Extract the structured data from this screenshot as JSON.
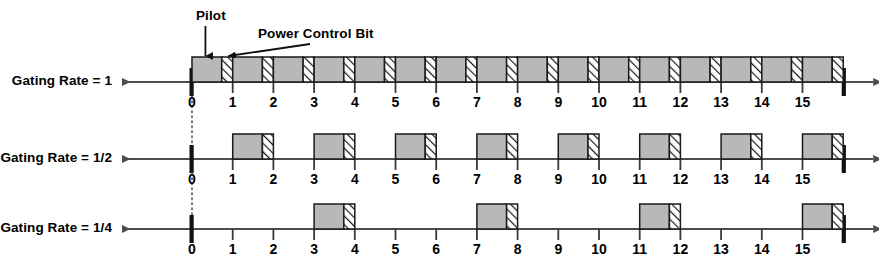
{
  "figure": {
    "type": "timing-diagram",
    "num_slots": 16,
    "slot_labels": [
      "0",
      "1",
      "2",
      "3",
      "4",
      "5",
      "6",
      "7",
      "8",
      "9",
      "10",
      "11",
      "12",
      "13",
      "14",
      "15"
    ],
    "colors": {
      "pilot_fill": "#b8b8b8",
      "hatch_fill": "#ffffff",
      "hatch_line": "#1a1a1a",
      "outline": "#1a1a1a",
      "axis": "#4d4d4d",
      "text": "#000000"
    },
    "annotations": [
      {
        "name": "pilot",
        "label": "Pilot",
        "arrow": "vertical-down",
        "target_slot": 0
      },
      {
        "name": "power-control-bit",
        "label": "Power Control Bit",
        "arrow": "diagonal-down-left",
        "target_slot": 0
      }
    ],
    "rows": [
      {
        "name": "gating-rate-1",
        "label": "Gating Rate = 1",
        "gating_rate": "1",
        "active_slots": [
          0,
          1,
          2,
          3,
          4,
          5,
          6,
          7,
          8,
          9,
          10,
          11,
          12,
          13,
          14,
          15
        ]
      },
      {
        "name": "gating-rate-1-2",
        "label": "Gating Rate = 1/2",
        "gating_rate": "1/2",
        "active_slots": [
          1,
          3,
          5,
          7,
          9,
          11,
          13,
          15
        ]
      },
      {
        "name": "gating-rate-1-4",
        "label": "Gating Rate = 1/4",
        "gating_rate": "1/4",
        "active_slots": [
          3,
          7,
          11,
          15
        ]
      }
    ]
  }
}
